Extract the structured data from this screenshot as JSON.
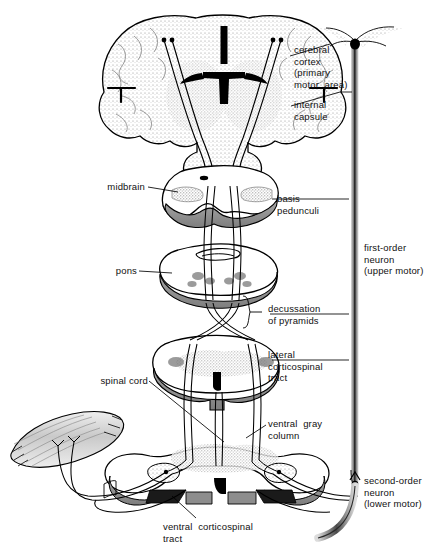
{
  "figure": {
    "type": "anatomical-diagram",
    "orientation": "vertical-series-of-cross-sections"
  },
  "labels": {
    "cerebral_cortex": "cerebral\ncortex\n(primary\nmotor  area)",
    "internal_capsule": "internal\ncapsule",
    "midbrain": "midbrain",
    "basis_pedunculi": "basis\npedunculi",
    "pons": "pons",
    "decussation_of_pyramids": "decussation\nof pyramids",
    "lateral_corticospinal_tract": "lateral\ncorticospinal\ntract",
    "spinal_cord": "spinal cord",
    "ventral_gray_column": "ventral  gray\ncolumn",
    "ventral_corticospinal_tract": "ventral  corticospinal\ntract",
    "first_order_neuron": "first-order\nneuron\n(upper motor)",
    "second_order_neuron": "second-order\nneuron\n(lower motor)"
  },
  "structures": [
    {
      "name": "cerebral-hemispheres-coronal-section",
      "level": 1
    },
    {
      "name": "midbrain-cross-section",
      "level": 2
    },
    {
      "name": "pons-cross-section",
      "level": 3
    },
    {
      "name": "medulla-decussation-section",
      "level": 4
    },
    {
      "name": "spinal-cord-cervical-section",
      "level": 5
    },
    {
      "name": "spinal-cord-lower-section",
      "level": 6
    },
    {
      "name": "skeletal-muscle",
      "level": 7
    }
  ],
  "colors": {
    "ink": "#000000",
    "gray_matter_stipple": "#9a9a9a",
    "band_gray": "#8e8e8e",
    "band_gray_light": "#b8b8b8",
    "paper": "#ffffff"
  }
}
